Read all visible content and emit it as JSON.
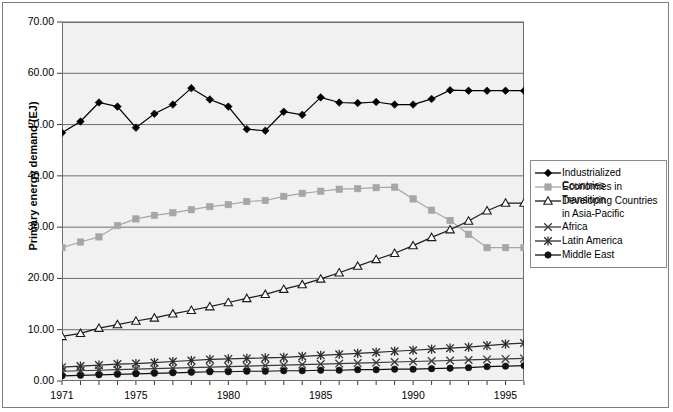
{
  "chart_data": {
    "type": "line",
    "title": "",
    "xlabel": "",
    "ylabel": "Primary energy demand (EJ)",
    "ylim": [
      0,
      70
    ],
    "ytick_labels": [
      "70.00",
      "60.00",
      "50.00",
      "40.00",
      "30.00",
      "20.00",
      "10.00",
      "0.00"
    ],
    "ytick_values": [
      70,
      60,
      50,
      40,
      30,
      20,
      10,
      0
    ],
    "grid": true,
    "legend_position": "right",
    "xlim": [
      1971,
      1996
    ],
    "x": [
      1971,
      1972,
      1973,
      1974,
      1975,
      1976,
      1977,
      1978,
      1979,
      1980,
      1981,
      1982,
      1983,
      1984,
      1985,
      1986,
      1987,
      1988,
      1989,
      1990,
      1991,
      1992,
      1993,
      1994,
      1995,
      1996
    ],
    "xtick_labels": [
      "1971",
      "1975",
      "1980",
      "1985",
      "1990",
      "1995"
    ],
    "xtick_values": [
      1971,
      1975,
      1980,
      1985,
      1990,
      1995
    ],
    "series": [
      {
        "name": "Industrialized Countries",
        "marker": "diamond",
        "color": "#000000",
        "values": [
          48.4,
          50.6,
          54.3,
          53.5,
          49.4,
          52.1,
          53.9,
          57.1,
          54.9,
          53.5,
          49.1,
          48.8,
          52.5,
          51.9,
          55.3,
          54.3,
          54.2,
          54.4,
          53.9,
          53.9,
          55.0,
          56.7,
          56.6,
          56.6,
          56.6,
          56.6
        ]
      },
      {
        "name": "Economies in Transition",
        "marker": "square",
        "color": "#a6a6a6",
        "values": [
          26.0,
          27.1,
          28.1,
          30.3,
          31.6,
          32.3,
          32.8,
          33.4,
          34.0,
          34.4,
          35.0,
          35.2,
          36.0,
          36.6,
          37.0,
          37.4,
          37.5,
          37.7,
          37.8,
          35.5,
          33.3,
          31.3,
          28.6,
          26.0,
          26.0,
          26.0
        ]
      },
      {
        "name": "Developing Countries\nin Asia-Pacific",
        "marker": "triangle",
        "color": "#1a1a1a",
        "values": [
          8.7,
          9.3,
          10.3,
          11.0,
          11.7,
          12.3,
          13.1,
          13.8,
          14.5,
          15.3,
          16.1,
          16.9,
          17.9,
          18.8,
          19.9,
          21.1,
          22.4,
          23.7,
          24.9,
          26.4,
          28.0,
          29.5,
          31.2,
          33.2,
          34.7,
          34.7
        ]
      },
      {
        "name": "Africa",
        "marker": "x",
        "color": "#3a3a3a",
        "values": [
          1.9,
          2.0,
          2.1,
          2.2,
          2.3,
          2.4,
          2.5,
          2.6,
          2.7,
          2.8,
          2.9,
          3.0,
          3.1,
          3.2,
          3.3,
          3.4,
          3.5,
          3.6,
          3.7,
          3.8,
          3.9,
          4.0,
          4.1,
          4.2,
          4.3,
          4.4
        ]
      },
      {
        "name": "Latin America",
        "marker": "star",
        "color": "#2b2b2b",
        "values": [
          2.7,
          2.9,
          3.1,
          3.3,
          3.4,
          3.6,
          3.8,
          4.0,
          4.2,
          4.3,
          4.4,
          4.5,
          4.6,
          4.8,
          5.0,
          5.2,
          5.4,
          5.6,
          5.8,
          6.0,
          6.2,
          6.4,
          6.6,
          6.9,
          7.2,
          7.4
        ]
      },
      {
        "name": "Middle East",
        "marker": "circle",
        "color": "#111111",
        "values": [
          1.0,
          1.1,
          1.2,
          1.3,
          1.4,
          1.5,
          1.6,
          1.7,
          1.8,
          1.8,
          1.9,
          1.9,
          2.0,
          2.0,
          2.1,
          2.1,
          2.2,
          2.2,
          2.3,
          2.3,
          2.4,
          2.5,
          2.6,
          2.8,
          2.9,
          3.0
        ]
      }
    ]
  },
  "legend": {
    "items": [
      {
        "label": "Industrialized Countries",
        "icon": "diamond-marker-icon"
      },
      {
        "label": "Economies in Transition",
        "icon": "square-marker-icon"
      },
      {
        "label": "Developing Countries\nin Asia-Pacific",
        "icon": "triangle-marker-icon"
      },
      {
        "label": "Africa",
        "icon": "x-marker-icon"
      },
      {
        "label": "Latin America",
        "icon": "star-marker-icon"
      },
      {
        "label": "Middle East",
        "icon": "circle-marker-icon"
      }
    ]
  }
}
